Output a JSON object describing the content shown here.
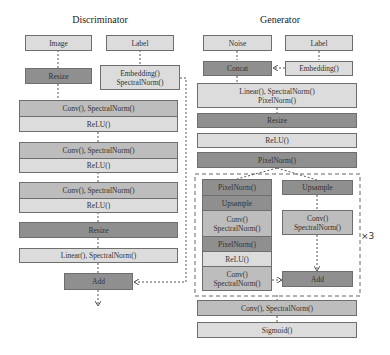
{
  "discriminator": {
    "title": "Discriminator",
    "image_label": "Image",
    "label_label": "Label",
    "resize1_label": "Resize",
    "embedding_line1": "Embedding()",
    "embedding_line2": "SpectralNorm()",
    "blocks": [
      {
        "conv": "Conv(), SpectralNorm()",
        "act": "ReLU()"
      },
      {
        "conv": "Conv(), SpectralNorm()",
        "act": "ReLU()"
      },
      {
        "conv": "Conv(), SpectralNorm()",
        "act": "ReLU()"
      }
    ],
    "resize2_label": "Resize",
    "linear_label": "Linear(), SpectralNorm()",
    "add_label": "Add"
  },
  "generator": {
    "title": "Generator",
    "noise_label": "Noise",
    "label_label": "Label",
    "concat_label": "Concat",
    "embedding_label": "Embedding()",
    "linear_line1": "Linear(), SpectralNorm()",
    "linear_line2": "PixelNorm()",
    "resize_label": "Resize",
    "relu_label": "ReLU()",
    "pixelnorm_label": "PixelNorm()",
    "residual_block": {
      "left": {
        "pixelnorm1": "PixelNorm()",
        "upsample": "Upsample",
        "conv1_line1": "Conv()",
        "conv1_line2": "SpectralNorm()",
        "pixelnorm2": "PixelNorm()",
        "relu": "ReLU()",
        "conv2_line1": "Conv()",
        "conv2_line2": "SpectralNorm()"
      },
      "right": {
        "upsample": "Upsample",
        "conv_line1": "Conv()",
        "conv_line2": "SpectralNorm()",
        "add": "Add"
      },
      "repeat": "×3"
    },
    "final_conv_label": "Conv(), SpectralNorm()",
    "sigmoid_label": "Sigmoid()"
  },
  "colors": {
    "light": "#dcdcdc",
    "mid": "#bdbdbd",
    "dark": "#8f8f8f",
    "border": "#6e6e6e"
  }
}
